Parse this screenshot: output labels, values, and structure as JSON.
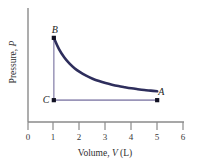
{
  "figure": {
    "background_color": "#ffffff",
    "axis_color": "#8a8a8a"
  },
  "chart_data": {
    "type": "line",
    "title": "",
    "subtitle": "",
    "xlabel_text": "Volume, ",
    "xlabel_symbol": "V",
    "xlabel_units": " (L)",
    "xlabel": "Volume, V (L)",
    "ylabel_text": "Pressure, ",
    "ylabel_symbol": "P",
    "ylabel": "Pressure, P",
    "xlim": [
      0,
      6
    ],
    "ylim": [
      0,
      1
    ],
    "xticks": [
      0,
      1,
      2,
      3,
      4,
      5,
      6
    ],
    "xtick_labels": [
      "0",
      "1",
      "2",
      "3",
      "4",
      "5",
      "6"
    ],
    "yticks": [],
    "ytick_labels": [],
    "grid": false,
    "legend": null,
    "annotations": [
      {
        "label": "B",
        "x": 1,
        "y": 0.88
      },
      {
        "label": "C",
        "x": 1,
        "y": 0.12
      },
      {
        "label": "A",
        "x": 5,
        "y": 0.12
      }
    ],
    "points": [
      {
        "name": "A",
        "x": 5,
        "y": 0.12
      },
      {
        "name": "B",
        "x": 1,
        "y": 0.88
      },
      {
        "name": "C",
        "x": 1,
        "y": 0.12
      }
    ],
    "series": [
      {
        "name": "isotherm-B-to-A",
        "style": "curve",
        "color": "#2e2e5c",
        "width": 2.6,
        "description": "hyperbolic isothermal expansion from B to A",
        "x": [
          1.0,
          1.2,
          1.4,
          1.6,
          1.8,
          2.0,
          2.25,
          2.5,
          2.75,
          3.0,
          3.25,
          3.5,
          3.75,
          4.0,
          4.25,
          4.5,
          4.75,
          5.0
        ],
        "y": [
          0.88,
          0.742,
          0.643,
          0.568,
          0.51,
          0.464,
          0.418,
          0.382,
          0.353,
          0.329,
          0.309,
          0.292,
          0.278,
          0.265,
          0.254,
          0.244,
          0.236,
          0.228
        ]
      },
      {
        "name": "segment-B-to-C",
        "style": "straight",
        "color": "#9a95b8",
        "width": 1.5,
        "description": "isochoric pressure drop from B to C",
        "x": [
          1,
          1
        ],
        "y": [
          0.88,
          0.12
        ]
      },
      {
        "name": "segment-C-to-A",
        "style": "straight",
        "color": "#9a95b8",
        "width": 1.8,
        "description": "isobaric expansion from C to A",
        "x": [
          1,
          5
        ],
        "y": [
          0.12,
          0.12
        ]
      }
    ]
  },
  "ticks": {
    "x": [
      {
        "label": "0",
        "px": 28
      },
      {
        "label": "1",
        "px": 53
      },
      {
        "label": "2",
        "px": 79
      },
      {
        "label": "3",
        "px": 105
      },
      {
        "label": "4",
        "px": 131
      },
      {
        "label": "5",
        "px": 157
      },
      {
        "label": "6",
        "px": 183
      }
    ]
  },
  "labels": {
    "point_a": "A",
    "point_b": "B",
    "point_c": "C"
  }
}
